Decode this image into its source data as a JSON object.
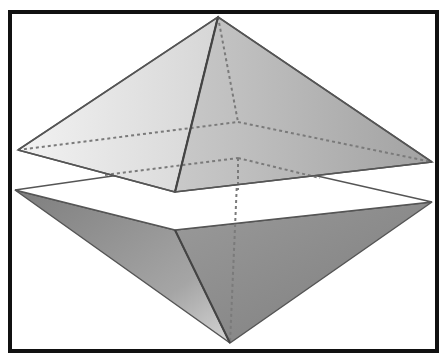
{
  "diagram": {
    "colors": {
      "background": "#ffffff",
      "border": "#111111",
      "edge": "#555555",
      "hidden_edge": "#7a7a7a",
      "light_face": "#e6e6e6",
      "mid_face": "#b5b5b5",
      "dark_face": "#8c8c8c"
    },
    "upper_pyramid": {
      "apex": [
        218,
        17
      ],
      "base": {
        "left": [
          18,
          150
        ],
        "front": [
          175,
          192
        ],
        "right": [
          432,
          162
        ],
        "back": [
          238,
          122
        ]
      }
    },
    "lower_pyramid": {
      "apex": [
        230,
        343
      ],
      "base": {
        "left": [
          15,
          190
        ],
        "front": [
          175,
          230
        ],
        "right": [
          432,
          202
        ],
        "back": [
          238,
          158
        ]
      }
    }
  }
}
